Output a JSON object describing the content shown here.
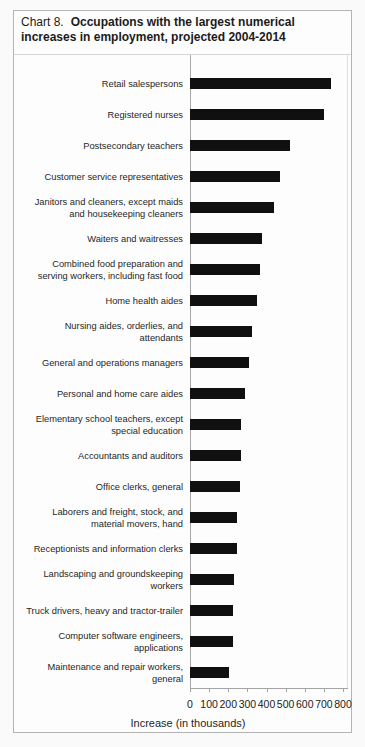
{
  "header": {
    "prefix": "Chart 8.",
    "title": "Occupations with the largest numerical\nincreases in employment, projected 2004-2014"
  },
  "chart_data": {
    "type": "bar",
    "orientation": "horizontal",
    "xlabel": "Increase (in thousands)",
    "ylabel": "",
    "xlim": [
      0,
      800
    ],
    "x_ticks": [
      0,
      100,
      200,
      300,
      400,
      500,
      600,
      700,
      800
    ],
    "grid": false,
    "legend": false,
    "bar_color": "#101010",
    "categories": [
      "Retail salespersons",
      "Registered nurses",
      "Postsecondary teachers",
      "Customer service representatives",
      "Janitors and cleaners, except maids\nand housekeeping cleaners",
      "Waiters and waitresses",
      "Combined food preparation and\nserving workers, including fast food",
      "Home health aides",
      "Nursing aides, orderlies, and\nattendants",
      "General and operations managers",
      "Personal and home care aides",
      "Elementary school teachers, except\nspecial education",
      "Accountants and auditors",
      "Office clerks, general",
      "Laborers and freight, stock, and\nmaterial movers, hand",
      "Receptionists and information clerks",
      "Landscaping and groundskeeping\nworkers",
      "Truck drivers, heavy and tractor-trailer",
      "Computer software engineers,\napplications",
      "Maintenance and repair workers,\ngeneral"
    ],
    "values": [
      736,
      703,
      524,
      471,
      440,
      376,
      367,
      350,
      325,
      308,
      287,
      265,
      264,
      263,
      248,
      246,
      230,
      223,
      222,
      202
    ]
  }
}
